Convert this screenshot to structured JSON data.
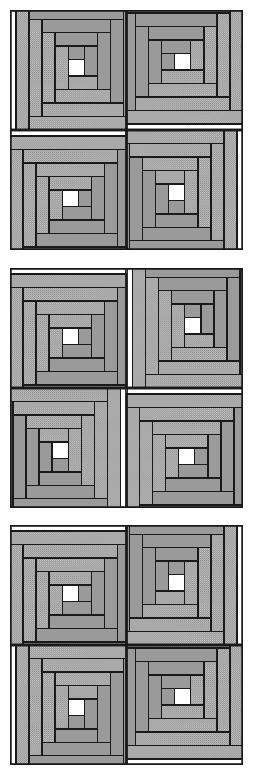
{
  "document": {
    "kind": "quilt-pattern-diagram",
    "title": "Log Cabin block arrangements",
    "panel_count": 3,
    "blocks_per_panel": 4,
    "grid": "2x2"
  },
  "palette": {
    "light_fabric": "#c8c8c8",
    "light_fabric_dot": "#8a8a8a",
    "dark_fabric": "#9a9a9a",
    "center_square": "#ffffff",
    "outline": "#1a1a1a",
    "background": "#ffffff"
  },
  "block_geometry": {
    "unit": 116,
    "log_width": 13,
    "center_size": 16,
    "center_offset_x": 58,
    "center_offset_y": 48,
    "ring_count": 4,
    "stroke_width": 1.4
  },
  "panels": [
    {
      "id": "panel-1",
      "name": "Arrangement A - Barn Raising",
      "blocks": [
        {
          "position": "top-left",
          "rotation": 0,
          "mirror": false
        },
        {
          "position": "top-right",
          "rotation": 270,
          "mirror": false
        },
        {
          "position": "bottom-left",
          "rotation": 90,
          "mirror": false
        },
        {
          "position": "bottom-right",
          "rotation": 180,
          "mirror": false
        }
      ]
    },
    {
      "id": "panel-2",
      "name": "Arrangement B - Straight Furrow",
      "blocks": [
        {
          "position": "top-left",
          "rotation": 90,
          "mirror": false
        },
        {
          "position": "top-right",
          "rotation": 0,
          "mirror": false
        },
        {
          "position": "bottom-left",
          "rotation": 180,
          "mirror": false
        },
        {
          "position": "bottom-right",
          "rotation": 90,
          "mirror": false
        }
      ]
    },
    {
      "id": "panel-3",
      "name": "Arrangement C - Sunshine and Shadow",
      "blocks": [
        {
          "position": "top-left",
          "rotation": 90,
          "mirror": false
        },
        {
          "position": "top-right",
          "rotation": 0,
          "mirror": true
        },
        {
          "position": "bottom-left",
          "rotation": 180,
          "mirror": true
        },
        {
          "position": "bottom-right",
          "rotation": 270,
          "mirror": false
        }
      ]
    }
  ],
  "log_sequence": [
    {
      "index": 1,
      "side": "top",
      "fabric": "dark"
    },
    {
      "index": 2,
      "side": "right",
      "fabric": "dark"
    },
    {
      "index": 3,
      "side": "bottom",
      "fabric": "light"
    },
    {
      "index": 4,
      "side": "left",
      "fabric": "light"
    },
    {
      "index": 5,
      "side": "top",
      "fabric": "dark"
    },
    {
      "index": 6,
      "side": "right",
      "fabric": "dark"
    },
    {
      "index": 7,
      "side": "bottom",
      "fabric": "light"
    },
    {
      "index": 8,
      "side": "left",
      "fabric": "light"
    },
    {
      "index": 9,
      "side": "top",
      "fabric": "dark"
    },
    {
      "index": 10,
      "side": "right",
      "fabric": "dark"
    },
    {
      "index": 11,
      "side": "bottom",
      "fabric": "light"
    },
    {
      "index": 12,
      "side": "left",
      "fabric": "light"
    },
    {
      "index": 13,
      "side": "top",
      "fabric": "dark"
    },
    {
      "index": 14,
      "side": "right",
      "fabric": "dark"
    },
    {
      "index": 15,
      "side": "bottom",
      "fabric": "light"
    },
    {
      "index": 16,
      "side": "left",
      "fabric": "light"
    }
  ]
}
